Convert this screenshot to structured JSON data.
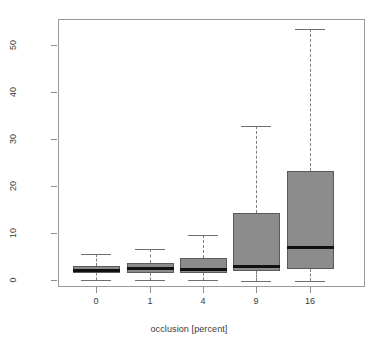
{
  "chart_data": {
    "type": "box",
    "title": "",
    "xlabel": "occlusion [percent]",
    "ylabel": "reprojection error [pixels]",
    "categories": [
      "0",
      "1",
      "4",
      "9",
      "16"
    ],
    "ylim": [
      -1.5,
      55.5
    ],
    "yticks": [
      0,
      10,
      20,
      30,
      40,
      50
    ],
    "ytick_labels": [
      "0",
      "10",
      "20",
      "30",
      "40",
      "50"
    ],
    "grid": false,
    "legend": null,
    "box_fill": "#8c8c8c",
    "box_edge": "#5a5a5a",
    "median_color": "#111111",
    "whisker_color": "#7d7d7d",
    "boxes": [
      {
        "category": "0",
        "whisker_low": 0.0,
        "q1": 1.5,
        "median": 2.1,
        "q3": 2.9,
        "whisker_high": 5.6
      },
      {
        "category": "1",
        "whisker_low": 0.0,
        "q1": 1.5,
        "median": 2.4,
        "q3": 3.6,
        "whisker_high": 6.7
      },
      {
        "category": "4",
        "whisker_low": -0.1,
        "q1": 1.5,
        "median": 2.3,
        "q3": 4.6,
        "whisker_high": 9.5
      },
      {
        "category": "9",
        "whisker_low": -0.2,
        "q1": 1.9,
        "median": 2.9,
        "q3": 14.3,
        "whisker_high": 32.7
      },
      {
        "category": "16",
        "whisker_low": -0.3,
        "q1": 2.3,
        "median": 7.0,
        "q3": 23.2,
        "whisker_high": 53.5
      }
    ]
  }
}
